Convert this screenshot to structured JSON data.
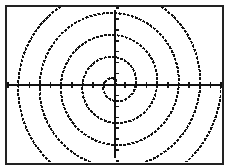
{
  "chart_data": {
    "type": "line",
    "title": "",
    "xlabel": "",
    "ylabel": "",
    "equation": "r = θ",
    "grid": false,
    "legend": null,
    "axes": {
      "x_ticks_visible": true,
      "y_ticks_visible": true,
      "labels_visible": false
    },
    "view": {
      "xmin": -10,
      "xmax": 10,
      "ymin": -7,
      "ymax": 7
    },
    "theta_range": [
      0,
      31.4
    ]
  },
  "colors": {
    "background": "#ffffff",
    "ink": "#111111",
    "frame": "#222222"
  }
}
